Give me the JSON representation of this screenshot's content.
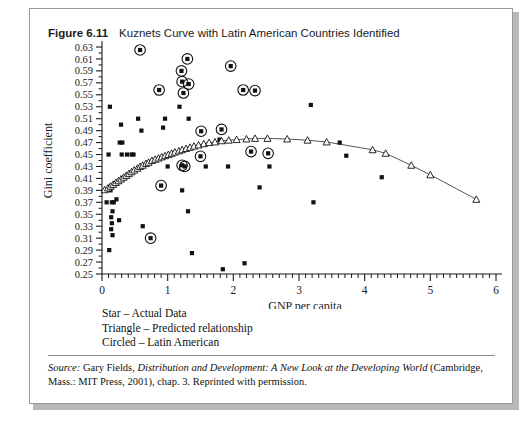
{
  "figure": {
    "number": "Figure 6.11",
    "title": "Kuznets Curve with Latin American Countries Identified"
  },
  "legend": {
    "line1": "Star – Actual Data",
    "line2": "Triangle – Predicted relationship",
    "line3": "Circled – Latin American"
  },
  "source": {
    "label": "Source:",
    "text_a": " Gary Fields, ",
    "work": "Distribution and Development: A New Look at the Developing World",
    "text_b": " (Cambridge, Mass.: MIT Press, 2001), chap. 3. Reprinted with permission."
  },
  "colors": {
    "axis": "#1a1a1a",
    "marker": "#111111",
    "curve": "#555555",
    "border": "#9a9a9a",
    "shadow": "#b8b8b8"
  },
  "chart_data": {
    "type": "scatter",
    "title": "Kuznets Curve with Latin American Countries Identified",
    "xlabel": "GNP per capita",
    "ylabel": "Gini coefficient",
    "xlim": [
      0,
      6
    ],
    "ylim": [
      0.25,
      0.63
    ],
    "xticks": [
      0,
      1,
      2,
      3,
      4,
      5,
      6
    ],
    "xtick_labels": [
      "0",
      "1",
      "2",
      "3",
      "4",
      "5",
      "6"
    ],
    "x_minor_tick_step": 0.1,
    "yticks": [
      0.25,
      0.27,
      0.29,
      0.31,
      0.33,
      0.35,
      0.37,
      0.39,
      0.41,
      0.43,
      0.45,
      0.47,
      0.49,
      0.51,
      0.53,
      0.55,
      0.57,
      0.59,
      0.61,
      0.63
    ],
    "ytick_labels": [
      "0.25",
      "0.27",
      "0.29",
      "0.31",
      "0.33",
      "0.35",
      "0.37",
      "0.39",
      "0.41",
      "0.43",
      "0.45",
      "0.47",
      "0.49",
      "0.51",
      "0.53",
      "0.55",
      "0.57",
      "0.59",
      "0.61",
      "0.63"
    ],
    "y_minor_tick_step": 0.01,
    "grid": false,
    "legend_position": "below-axes",
    "series": [
      {
        "name": "Star – Actual Data",
        "marker": "star",
        "points": [
          [
            0.12,
            0.53
          ],
          [
            0.1,
            0.45
          ],
          [
            0.13,
            0.39
          ],
          [
            0.07,
            0.37
          ],
          [
            0.15,
            0.37
          ],
          [
            0.18,
            0.37
          ],
          [
            0.16,
            0.355
          ],
          [
            0.14,
            0.345
          ],
          [
            0.15,
            0.335
          ],
          [
            0.14,
            0.325
          ],
          [
            0.16,
            0.315
          ],
          [
            0.11,
            0.29
          ],
          [
            0.22,
            0.375
          ],
          [
            0.27,
            0.47
          ],
          [
            0.31,
            0.47
          ],
          [
            0.3,
            0.45
          ],
          [
            0.38,
            0.45
          ],
          [
            0.29,
            0.5
          ],
          [
            0.26,
            0.34
          ],
          [
            0.45,
            0.45
          ],
          [
            0.48,
            0.45
          ],
          [
            0.55,
            0.51
          ],
          [
            0.6,
            0.49
          ],
          [
            0.62,
            0.33
          ],
          [
            0.96,
            0.51
          ],
          [
            0.93,
            0.495
          ],
          [
            1.0,
            0.43
          ],
          [
            1.18,
            0.53
          ],
          [
            1.22,
            0.39
          ],
          [
            1.32,
            0.51
          ],
          [
            1.31,
            0.355
          ],
          [
            1.37,
            0.285
          ],
          [
            1.58,
            0.43
          ],
          [
            1.79,
            0.475
          ],
          [
            1.84,
            0.258
          ],
          [
            1.92,
            0.43
          ],
          [
            2.17,
            0.268
          ],
          [
            2.4,
            0.395
          ],
          [
            2.55,
            0.43
          ],
          [
            3.18,
            0.533
          ],
          [
            3.22,
            0.37
          ],
          [
            3.62,
            0.47
          ],
          [
            3.72,
            0.448
          ],
          [
            4.26,
            0.412
          ]
        ]
      },
      {
        "name": "Circled – Latin American",
        "marker": "star-circled",
        "points": [
          [
            0.58,
            0.625
          ],
          [
            1.3,
            0.61
          ],
          [
            1.21,
            0.59
          ],
          [
            1.22,
            0.572
          ],
          [
            1.32,
            0.568
          ],
          [
            1.24,
            0.553
          ],
          [
            0.87,
            0.558
          ],
          [
            1.96,
            0.598
          ],
          [
            2.15,
            0.558
          ],
          [
            2.33,
            0.557
          ],
          [
            1.51,
            0.489
          ],
          [
            1.82,
            0.492
          ],
          [
            2.27,
            0.455
          ],
          [
            2.53,
            0.452
          ],
          [
            1.5,
            0.447
          ],
          [
            1.22,
            0.432
          ],
          [
            1.26,
            0.43
          ],
          [
            0.9,
            0.398
          ],
          [
            0.74,
            0.31
          ]
        ]
      },
      {
        "name": "Triangle – Predicted relationship",
        "marker": "triangle",
        "points": [
          [
            0.04,
            0.391
          ],
          [
            0.09,
            0.394
          ],
          [
            0.13,
            0.397
          ],
          [
            0.17,
            0.4
          ],
          [
            0.21,
            0.403
          ],
          [
            0.25,
            0.406
          ],
          [
            0.29,
            0.409
          ],
          [
            0.33,
            0.412
          ],
          [
            0.37,
            0.415
          ],
          [
            0.41,
            0.418
          ],
          [
            0.45,
            0.421
          ],
          [
            0.49,
            0.424
          ],
          [
            0.54,
            0.427
          ],
          [
            0.58,
            0.43
          ],
          [
            0.62,
            0.432
          ],
          [
            0.67,
            0.435
          ],
          [
            0.71,
            0.437
          ],
          [
            0.76,
            0.44
          ],
          [
            0.81,
            0.442
          ],
          [
            0.86,
            0.444
          ],
          [
            0.91,
            0.446
          ],
          [
            0.96,
            0.448
          ],
          [
            1.01,
            0.45
          ],
          [
            1.06,
            0.452
          ],
          [
            1.11,
            0.454
          ],
          [
            1.17,
            0.456
          ],
          [
            1.22,
            0.458
          ],
          [
            1.28,
            0.46
          ],
          [
            1.34,
            0.462
          ],
          [
            1.4,
            0.464
          ],
          [
            1.47,
            0.466
          ],
          [
            1.55,
            0.468
          ],
          [
            1.63,
            0.47
          ],
          [
            1.72,
            0.471
          ],
          [
            1.82,
            0.473
          ],
          [
            1.93,
            0.474
          ],
          [
            2.05,
            0.475
          ],
          [
            2.2,
            0.476
          ],
          [
            2.33,
            0.477
          ],
          [
            2.52,
            0.477
          ],
          [
            2.82,
            0.476
          ],
          [
            3.13,
            0.474
          ],
          [
            3.42,
            0.471
          ],
          [
            4.12,
            0.458
          ],
          [
            4.32,
            0.452
          ],
          [
            4.71,
            0.432
          ],
          [
            5.0,
            0.416
          ],
          [
            5.7,
            0.375
          ]
        ]
      }
    ]
  }
}
